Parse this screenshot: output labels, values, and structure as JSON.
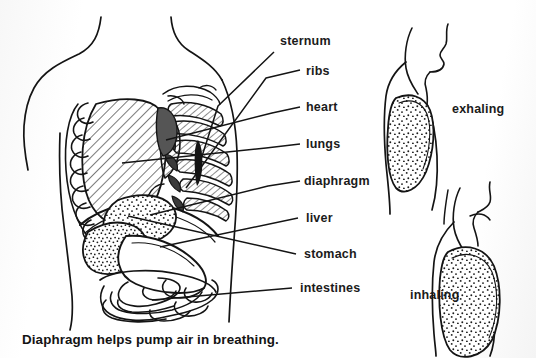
{
  "figure": {
    "caption": "Diaphragm helps pump air in breathing.",
    "title": "Diaphragm helps pump air in breathing."
  },
  "labels": {
    "sternum": "sternum",
    "ribs": "ribs",
    "heart": "heart",
    "lungs": "lungs",
    "diaphragm": "diaphragm",
    "liver": "liver",
    "stomach": "stomach",
    "intestines": "intestines"
  },
  "side_figures": {
    "exhaling": "exhaling",
    "inhaling": "inhaling"
  },
  "colors": {
    "ink": "#141414",
    "background": "#fefefe",
    "hatch": "#2a2a2a",
    "stipple": "#1c1c1c"
  },
  "style": {
    "line_art": "black ink line drawing",
    "fill_lung": "diagonal hatching",
    "fill_stomach": "stipple dots",
    "fill_heart": "dark solid"
  }
}
